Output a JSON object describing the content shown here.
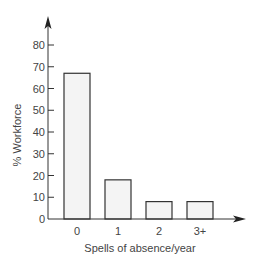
{
  "chart_data": {
    "type": "bar",
    "title": "",
    "xlabel": "Spells of absence/year",
    "ylabel": "% Workforce",
    "categories": [
      "0",
      "1",
      "2",
      "3+"
    ],
    "values": [
      67,
      18,
      8,
      8
    ],
    "ylim": [
      0,
      80
    ],
    "yticks": [
      0,
      10,
      20,
      30,
      40,
      50,
      60,
      70,
      80
    ],
    "grid": false,
    "legend": null,
    "bar_fill": "#f4f4f4",
    "bar_stroke": "#333333",
    "axis_color": "#333333"
  }
}
